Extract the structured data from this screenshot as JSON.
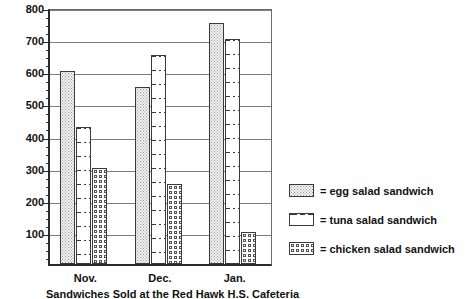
{
  "chart_data": {
    "type": "bar",
    "title": "Sandwiches Sold at the Red Hawk H.S. Cafeteria",
    "xlabel": "",
    "ylabel": "",
    "ylim": [
      0,
      800
    ],
    "ytick_step": 100,
    "yminor_step": 25,
    "grid": true,
    "legend_position": "right",
    "categories": [
      "Nov.",
      "Dec.",
      "Jan."
    ],
    "series": [
      {
        "name": "egg  salad  sandwich",
        "pattern": "stipple",
        "values": [
          600,
          550,
          750
        ]
      },
      {
        "name": "tuna  salad  sandwich",
        "pattern": "dashed-lines",
        "values": [
          425,
          650,
          700
        ]
      },
      {
        "name": "chicken  salad  sandwich",
        "pattern": "circles",
        "values": [
          300,
          250,
          100
        ]
      }
    ],
    "ytick_labels": [
      "800",
      "700",
      "600",
      "500",
      "400",
      "300",
      "200",
      "100"
    ],
    "ytick_values": [
      800,
      700,
      600,
      500,
      400,
      300,
      200,
      100
    ]
  },
  "legend": {
    "equals": "=",
    "entries": [
      {
        "label": "egg  salad  sandwich"
      },
      {
        "label": "tuna  salad  sandwich"
      },
      {
        "label": "chicken  salad  sandwich"
      }
    ]
  },
  "caption": {
    "text": "Sandwiches Sold at the Red Hawk H.S. Cafeteria"
  },
  "colors": {
    "axis": "#2a2a2a",
    "grid": "#7c7c7c",
    "bar_outline": "#3a3a3a",
    "egg_fill": "#f2f2f2",
    "tuna_fill": "#fdfdfd",
    "chicken_fill": "#ffffff",
    "text": "#111111",
    "background": "#ffffff"
  }
}
